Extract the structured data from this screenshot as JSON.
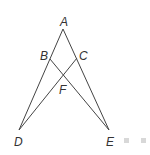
{
  "diagram": {
    "points": {
      "A": {
        "label": "A",
        "x": 63,
        "y": 29
      },
      "B": {
        "label": "B",
        "x": 50,
        "y": 59
      },
      "C": {
        "label": "C",
        "x": 77,
        "y": 58
      },
      "D": {
        "label": "D",
        "x": 19,
        "y": 130
      },
      "E": {
        "label": "E",
        "x": 109,
        "y": 130
      },
      "F": {
        "label": "F",
        "x": 63,
        "y": 75
      }
    },
    "segments": [
      [
        "A",
        "D"
      ],
      [
        "A",
        "E"
      ],
      [
        "B",
        "E"
      ],
      [
        "C",
        "D"
      ]
    ],
    "line_color": "#444444",
    "decoration_color": "#d8d8d8"
  }
}
